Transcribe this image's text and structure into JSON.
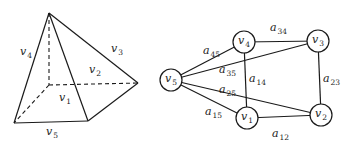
{
  "pyramid": {
    "vertices": {
      "apex": [
        49,
        13
      ],
      "front_left": [
        14,
        123
      ],
      "front_right": [
        88,
        121
      ],
      "back_right": [
        138,
        83
      ],
      "back_left": [
        49,
        85
      ]
    },
    "face_labels": [
      {
        "id": "v4",
        "base": "v",
        "sub": "4",
        "x": 20,
        "y": 55
      },
      {
        "id": "v3",
        "base": "v",
        "sub": "3",
        "x": 111,
        "y": 52
      },
      {
        "id": "v2",
        "base": "v",
        "sub": "2",
        "x": 89,
        "y": 73
      },
      {
        "id": "v1",
        "base": "v",
        "sub": "1",
        "x": 59,
        "y": 101
      },
      {
        "id": "v5",
        "base": "v",
        "sub": "5",
        "x": 46,
        "y": 135
      }
    ]
  },
  "graph": {
    "nodes": [
      {
        "id": "v5",
        "base": "v",
        "sub": "5",
        "cx": 171,
        "cy": 80
      },
      {
        "id": "v4",
        "base": "v",
        "sub": "4",
        "cx": 244,
        "cy": 42
      },
      {
        "id": "v3",
        "base": "v",
        "sub": "3",
        "cx": 318,
        "cy": 41
      },
      {
        "id": "v1",
        "base": "v",
        "sub": "1",
        "cx": 247,
        "cy": 118
      },
      {
        "id": "v2",
        "base": "v",
        "sub": "2",
        "cx": 321,
        "cy": 115
      }
    ],
    "edges": [
      {
        "from": "v5",
        "to": "v4",
        "label": "a",
        "sub": "45",
        "x": 203,
        "y": 54
      },
      {
        "from": "v5",
        "to": "v3",
        "label": "a",
        "sub": "35",
        "x": 219,
        "y": 73
      },
      {
        "from": "v5",
        "to": "v2",
        "label": "a",
        "sub": "25",
        "x": 219,
        "y": 93
      },
      {
        "from": "v5",
        "to": "v1",
        "label": "a",
        "sub": "15",
        "x": 205,
        "y": 115
      },
      {
        "from": "v4",
        "to": "v3",
        "label": "a",
        "sub": "34",
        "x": 270,
        "y": 31
      },
      {
        "from": "v4",
        "to": "v1",
        "label": "a",
        "sub": "14",
        "x": 249,
        "y": 82
      },
      {
        "from": "v3",
        "to": "v2",
        "label": "a",
        "sub": "23",
        "x": 323,
        "y": 82
      },
      {
        "from": "v1",
        "to": "v2",
        "label": "a",
        "sub": "12",
        "x": 272,
        "y": 137
      }
    ],
    "node_radius": 11
  }
}
